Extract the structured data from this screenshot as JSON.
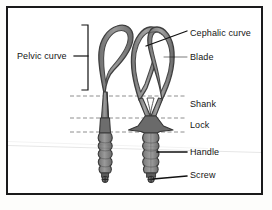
{
  "figure": {
    "type": "labelled-line-drawing",
    "background_color": "#ffffff",
    "frame_color": "#1a1a1a",
    "instrument_stroke_color": "#4a4a4a",
    "instrument_fill_color": "#8d8d8d",
    "guide_line_color": "#5a5a5a",
    "leader_line_color": "#111111"
  },
  "labels": {
    "pelvic_curve": "Pelvic curve",
    "cephalic_curve": "Cephalic curve",
    "blade": "Blade",
    "shank": "Shank",
    "lock": "Lock",
    "handle": "Handle",
    "screw": "Screw"
  },
  "annotations": [
    {
      "name": "pelvic-curve",
      "text": "Pelvic curve",
      "connector": "bracket",
      "side": "left",
      "bracket_top_y": 25,
      "bracket_bottom_y": 90,
      "bracket_x": 88,
      "tick_y": 56
    },
    {
      "name": "cephalic-curve",
      "text": "Cephalic curve",
      "connector": "diagonal-leader",
      "side": "right",
      "from": [
        187,
        32
      ],
      "to": [
        145,
        46
      ]
    },
    {
      "name": "blade",
      "text": "Blade",
      "connector": "horizontal-leader",
      "side": "right",
      "from": [
        187,
        57
      ],
      "to": [
        163,
        57
      ]
    },
    {
      "name": "shank",
      "text": "Shank",
      "connector": "dashed-guide",
      "side": "right",
      "guide_y": 96,
      "guide_x_start": 70,
      "guide_x_end": 186
    },
    {
      "name": "lock",
      "text": "Lock",
      "connector": "dashed-guide",
      "side": "right",
      "guide_y": 118,
      "guide_x_start": 70,
      "guide_x_end": 186
    },
    {
      "name": "lock-lower-guide",
      "text": "",
      "connector": "dashed-guide",
      "side": "right",
      "guide_y": 132,
      "guide_x_start": 70,
      "guide_x_end": 186
    },
    {
      "name": "handle",
      "text": "Handle",
      "connector": "horizontal-leader",
      "side": "right",
      "from": [
        187,
        152
      ],
      "to": [
        155,
        152
      ]
    },
    {
      "name": "screw",
      "text": "Screw",
      "connector": "horizontal-leader",
      "side": "right",
      "from": [
        187,
        175
      ],
      "to": [
        152,
        176
      ]
    }
  ],
  "parts": [
    {
      "name": "left-forceps-side-view",
      "description": "Single forceps blade shown in profile with pelvic curve loop, shank, lock and fluted handle ending in a screw."
    },
    {
      "name": "right-forceps-front-view",
      "description": "Pair of forceps blades shown face-on with cephalic curve, converging shanks, lock plate, fluted handle and screw."
    }
  ]
}
